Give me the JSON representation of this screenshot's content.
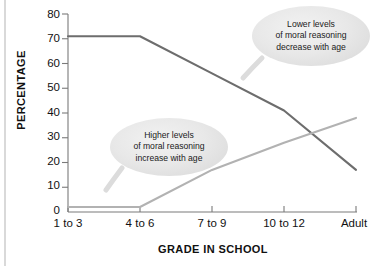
{
  "chart_data": {
    "type": "line",
    "title": "",
    "xlabel": "GRADE IN SCHOOL",
    "ylabel": "PERCENTAGE",
    "categories": [
      "1 to 3",
      "4 to 6",
      "7 to 9",
      "10 to 12",
      "Adult"
    ],
    "ylim": [
      0,
      80
    ],
    "ytick_labels": [
      "0",
      "10",
      "20",
      "30",
      "40",
      "50",
      "60",
      "70",
      "80"
    ],
    "ytick_values": [
      0,
      10,
      20,
      30,
      40,
      50,
      60,
      70,
      80
    ],
    "grid": false,
    "legend": "none",
    "series": [
      {
        "name": "Lower levels of moral reasoning",
        "color": "#6d6d6d",
        "values": [
          71,
          71,
          56,
          41,
          17
        ]
      },
      {
        "name": "Higher levels of moral reasoning",
        "color": "#b2b2b2",
        "values": [
          2,
          2,
          17,
          28,
          38
        ]
      }
    ],
    "annotations": [
      {
        "id": "callout-lower",
        "lines": [
          "Lower levels",
          "of moral reasoning",
          "decrease with age"
        ],
        "text": "Lower levels of moral reasoning decrease with age"
      },
      {
        "id": "callout-higher",
        "lines": [
          "Higher levels",
          "of moral reasoning",
          "increase with age"
        ],
        "text": "Higher levels of moral reasoning increase with age"
      }
    ]
  },
  "axis": {
    "y_title": "PERCENTAGE",
    "x_title": "GRADE IN SCHOOL",
    "y_ticks": [
      "80",
      "70",
      "60",
      "50",
      "40",
      "30",
      "20",
      "10",
      "0"
    ],
    "x_ticks": [
      "1 to 3",
      "4 to 6",
      "7 to 9",
      "10 to 12",
      "Adult"
    ]
  },
  "callouts": {
    "lower": {
      "line1": "Lower levels",
      "line2": "of moral reasoning",
      "line3": "decrease with age"
    },
    "higher": {
      "line1": "Higher levels",
      "line2": "of moral reasoning",
      "line3": "increase with age"
    }
  }
}
